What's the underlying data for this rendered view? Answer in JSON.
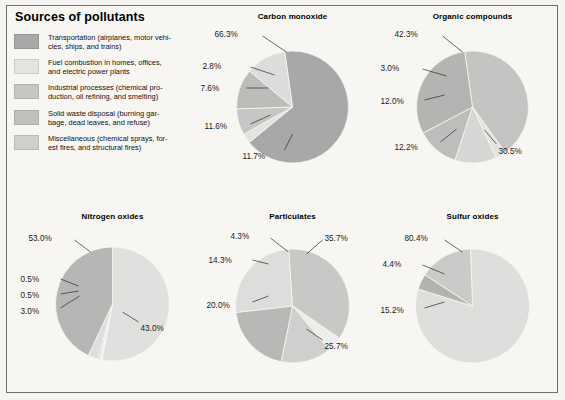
{
  "figure": {
    "background": "#f7f6f3",
    "border_color": "#6e6e6e"
  },
  "legend": {
    "title": "Sources of pollutants",
    "items": [
      {
        "key": "transportation",
        "color": "#a8a8a8",
        "label": "Transportation (airplanes, motor vehi-\ncles, ships, and trains)"
      },
      {
        "key": "fuel_combustion",
        "color": "#e3e3e1",
        "label": "Fuel combustion in homes, offices,\nand electric power plants"
      },
      {
        "key": "industrial_processes",
        "color": "#c6c6c4",
        "label": "Industrial processes (chemical pro-\nduction, oil refining, and smelting)"
      },
      {
        "key": "solid_waste",
        "color": "#c0c0be",
        "label": "Solid waste disposal (burning gar-\nbage, dead leaves, and refuse)"
      },
      {
        "key": "miscellaneous",
        "color": "#cfcfcd",
        "label": "Miscellaneous (chemical sprays, for-\nest fires, and structural fires)"
      }
    ]
  },
  "chart_data": [
    {
      "type": "pie",
      "title": "Carbon monoxide",
      "categories": [
        "Transportation",
        "Fuel combustion",
        "Industrial processes",
        "Solid waste disposal",
        "Miscellaneous"
      ],
      "values": [
        66.3,
        2.8,
        7.6,
        11.6,
        11.7
      ],
      "labels": [
        "66.3%",
        "2.8%",
        "7.6%",
        "11.6%",
        "11.7%"
      ],
      "colors": [
        "#a8a8a8",
        "#e3e3e1",
        "#c6c6c4",
        "#bcbcba",
        "#dcdcda"
      ],
      "start_angle": -8,
      "legend_position": "external-callouts"
    },
    {
      "type": "pie",
      "title": "Organic compounds",
      "categories": [
        "Transportation",
        "Fuel combustion",
        "Industrial processes",
        "Solid waste disposal",
        "Miscellaneous"
      ],
      "values": [
        42.3,
        3.0,
        12.0,
        12.2,
        30.5
      ],
      "labels": [
        "42.3%",
        "3.0%",
        "12.0%",
        "12.2%",
        "30.5%"
      ],
      "colors": [
        "#c4c4c2",
        "#e3e3e1",
        "#d6d6d4",
        "#bdbdbb",
        "#b4b4b2"
      ],
      "start_angle": -8,
      "legend_position": "external-callouts"
    },
    {
      "type": "pie",
      "title": "Nitrogen oxides",
      "categories": [
        "Transportation",
        "Fuel combustion",
        "Industrial processes",
        "Solid waste disposal",
        "Miscellaneous"
      ],
      "values": [
        53.0,
        0.5,
        0.5,
        3.0,
        43.0
      ],
      "labels": [
        "53.0%",
        "0.5%",
        "0.5%",
        "3.0%",
        "43.0%"
      ],
      "colors": [
        "#e0e0de",
        "#f2f2f0",
        "#d2d2d0",
        "#dedede",
        "#b6b6b4"
      ],
      "start_angle": 0,
      "legend_position": "external-callouts"
    },
    {
      "type": "pie",
      "title": "Particulates",
      "categories": [
        "Transportation",
        "Fuel combustion",
        "Industrial processes",
        "Solid waste disposal",
        "Miscellaneous"
      ],
      "values": [
        35.7,
        4.3,
        14.3,
        20.0,
        25.7
      ],
      "labels": [
        "35.7%",
        "4.3%",
        "14.3%",
        "20.0%",
        "25.7%"
      ],
      "colors": [
        "#c8c8c6",
        "#ededeb",
        "#cfcfcd",
        "#b8b8b6",
        "#dddddb"
      ],
      "start_angle": -4,
      "legend_position": "external-callouts"
    },
    {
      "type": "pie",
      "title": "Sulfur oxides",
      "categories": [
        "Transportation",
        "Fuel combustion",
        "Industrial processes",
        "Solid waste disposal",
        "Miscellaneous"
      ],
      "values": [
        80.4,
        4.4,
        15.2
      ],
      "labels": [
        "80.4%",
        "4.4%",
        "15.2%"
      ],
      "colors": [
        "#dededc",
        "#b2b2b0",
        "#cacac8"
      ],
      "start_angle": -2,
      "legend_position": "external-callouts"
    }
  ]
}
